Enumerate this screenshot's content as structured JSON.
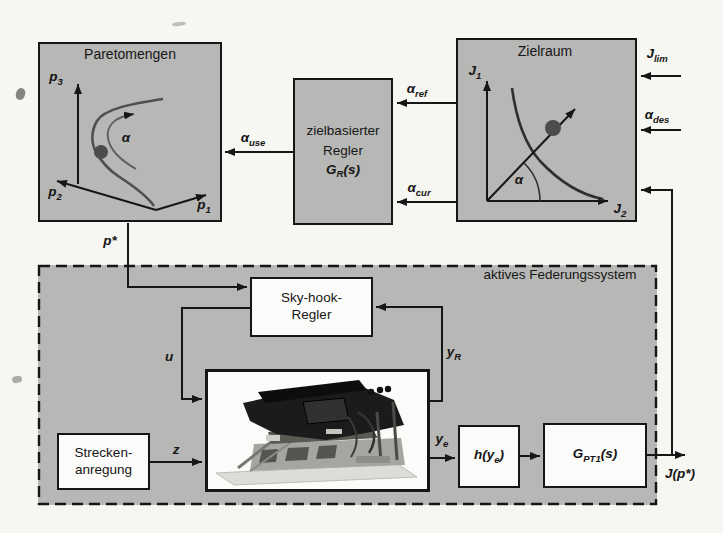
{
  "figure": {
    "type": "control-system block diagram",
    "language": "German"
  },
  "colors": {
    "paper": "#f6f6f3",
    "boxgray": "#b7b7b5",
    "boxwhite": "#fbfbf9",
    "ink": "#161616",
    "curve": "#4f4f4f",
    "dot": "#4c4c4c"
  },
  "boxes": {
    "paretomengen": {
      "title": "Paretomengen",
      "axis_p1": {
        "base": "p",
        "sub": "1"
      },
      "axis_p2": {
        "base": "p",
        "sub": "2"
      },
      "axis_p3": {
        "base": "p",
        "sub": "3"
      },
      "curve_label": "α"
    },
    "regler": {
      "line1": "zielbasierter",
      "line2": "Regler",
      "tf": {
        "base": "G",
        "sub": "R",
        "post": "(s)"
      }
    },
    "zielraum": {
      "title": "Zielraum",
      "axis_j1": {
        "base": "J",
        "sub": "1"
      },
      "axis_j2": {
        "base": "J",
        "sub": "2"
      },
      "angle_label": "α"
    },
    "federungssystem": {
      "title": "aktives Federungssystem"
    },
    "skyhook": {
      "line1": "Sky-hook-",
      "line2": "Regler"
    },
    "strecken": {
      "line1": "Strecken-",
      "line2": "anregung"
    },
    "h_block": {
      "pre": "h(y",
      "sub": "e",
      "post": ")"
    },
    "g_block": {
      "base": "G",
      "sub": "PT1",
      "post": "(s)"
    }
  },
  "signals": {
    "alpha_ref": {
      "base": "α",
      "sub": "ref"
    },
    "alpha_cur": {
      "base": "α",
      "sub": "cur"
    },
    "alpha_use": {
      "base": "α",
      "sub": "use"
    },
    "alpha_des": {
      "base": "α",
      "sub": "des"
    },
    "j_lim": {
      "base": "J",
      "sub": "lim"
    },
    "p_star": "p*",
    "u": "u",
    "z": "z",
    "y_r": {
      "base": "y",
      "sub": "R"
    },
    "y_e": {
      "base": "y",
      "sub": "e"
    },
    "j_p_star": "J(p*)"
  }
}
